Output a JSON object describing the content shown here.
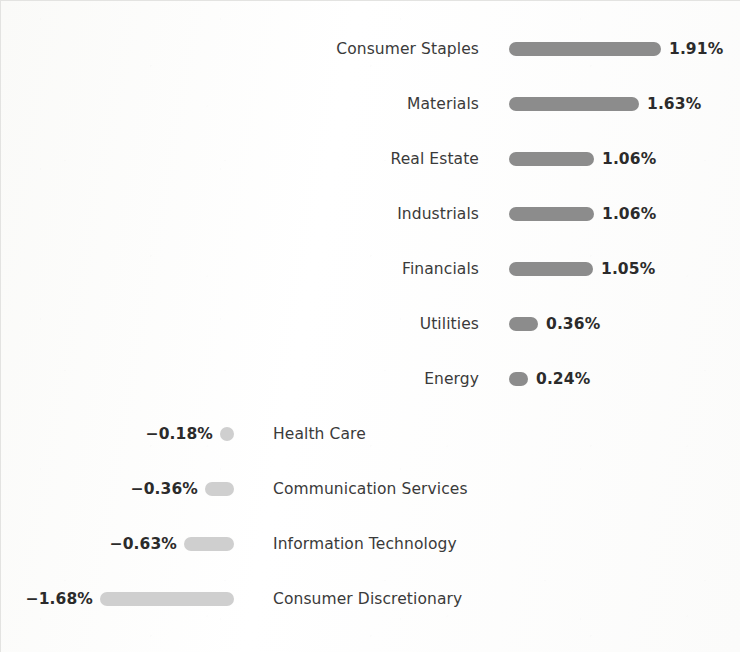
{
  "chart_data": {
    "type": "bar",
    "orientation": "horizontal",
    "title": "",
    "subtitle": "",
    "xlabel": "",
    "ylabel": "",
    "grid": false,
    "legend": false,
    "value_suffix": "%",
    "negative_sign": "−",
    "axis_zero_x_px": 233,
    "px_per_unit": 80,
    "xlim": [
      -1.68,
      1.91
    ],
    "colors": {
      "positive_bar": "#8c8c8c",
      "negative_bar": "#cfcfcf",
      "value_text": "#2b2b2b",
      "category_text": "#3a3a3a",
      "background": "#fdfdfc"
    },
    "categories": [
      "Consumer Staples",
      "Materials",
      "Real Estate",
      "Industrials",
      "Financials",
      "Utilities",
      "Energy",
      "Health Care",
      "Communication Services",
      "Information Technology",
      "Consumer Discretionary"
    ],
    "values": [
      1.91,
      1.63,
      1.06,
      1.06,
      1.05,
      0.36,
      0.24,
      -0.18,
      -0.36,
      -0.63,
      -1.68
    ],
    "labels": [
      "1.91%",
      "1.63%",
      "1.06%",
      "1.06%",
      "1.05%",
      "0.36%",
      "0.24%",
      "−0.18%",
      "−0.36%",
      "−0.63%",
      "−1.68%"
    ]
  },
  "rows": [
    {
      "category": "Consumer Staples",
      "value": 1.91,
      "label": "1.91%",
      "sign": "positive",
      "bar_px": 152,
      "top": 33
    },
    {
      "category": "Materials",
      "value": 1.63,
      "label": "1.63%",
      "sign": "positive",
      "bar_px": 130,
      "top": 88
    },
    {
      "category": "Real Estate",
      "value": 1.06,
      "label": "1.06%",
      "sign": "positive",
      "bar_px": 85,
      "top": 143
    },
    {
      "category": "Industrials",
      "value": 1.06,
      "label": "1.06%",
      "sign": "positive",
      "bar_px": 85,
      "top": 198
    },
    {
      "category": "Financials",
      "value": 1.05,
      "label": "1.05%",
      "sign": "positive",
      "bar_px": 84,
      "top": 253
    },
    {
      "category": "Utilities",
      "value": 0.36,
      "label": "0.36%",
      "sign": "positive",
      "bar_px": 29,
      "top": 308
    },
    {
      "category": "Energy",
      "value": 0.24,
      "label": "0.24%",
      "sign": "positive",
      "bar_px": 19,
      "top": 363
    },
    {
      "category": "Health Care",
      "value": -0.18,
      "label": "−0.18%",
      "sign": "negative",
      "bar_px": 14,
      "top": 418
    },
    {
      "category": "Communication Services",
      "value": -0.36,
      "label": "−0.36%",
      "sign": "negative",
      "bar_px": 29,
      "top": 473
    },
    {
      "category": "Information Technology",
      "value": -0.63,
      "label": "−0.63%",
      "sign": "negative",
      "bar_px": 50,
      "top": 528
    },
    {
      "category": "Consumer Discretionary",
      "value": -1.68,
      "label": "−1.68%",
      "sign": "negative",
      "bar_px": 134,
      "top": 583
    }
  ]
}
